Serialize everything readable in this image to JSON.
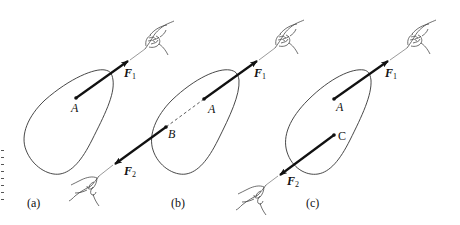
{
  "figure": {
    "colors": {
      "ink": "#111111",
      "outline": "#333333",
      "background": "#ffffff"
    },
    "panels": [
      {
        "id": "a",
        "label": "(a)",
        "points": [
          {
            "name": "A"
          }
        ],
        "forces": [
          {
            "name": "F",
            "sub": "1"
          }
        ]
      },
      {
        "id": "b",
        "label": "(b)",
        "points": [
          {
            "name": "A"
          },
          {
            "name": "B"
          }
        ],
        "forces": [
          {
            "name": "F",
            "sub": "1"
          },
          {
            "name": "F",
            "sub": "2"
          }
        ],
        "dashed_segment": "A-B"
      },
      {
        "id": "c",
        "label": "(c)",
        "points": [
          {
            "name": "A"
          },
          {
            "name": "C"
          }
        ],
        "forces": [
          {
            "name": "F",
            "sub": "1"
          },
          {
            "name": "F",
            "sub": "2"
          }
        ]
      }
    ]
  }
}
